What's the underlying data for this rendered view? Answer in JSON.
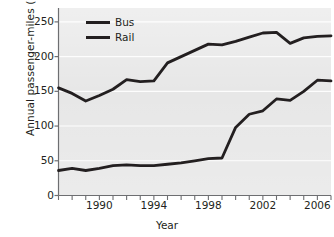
{
  "chart_data": {
    "type": "line",
    "title": "",
    "xlabel": "Year",
    "ylabel": "Annual passenger-miles (millions)",
    "xlim": [
      1987,
      2007
    ],
    "ylim": [
      0,
      270
    ],
    "yticks": [
      0,
      50,
      100,
      150,
      200,
      250
    ],
    "ytick_labels": [
      "0",
      "50",
      "100",
      "150",
      "200",
      "250"
    ],
    "xticks": [
      1987,
      1988,
      1989,
      1990,
      1991,
      1992,
      1993,
      1994,
      1995,
      1996,
      1997,
      1998,
      1999,
      2000,
      2001,
      2002,
      2003,
      2004,
      2005,
      2006,
      2007
    ],
    "xtick_labels_shown": [
      "1990",
      "1994",
      "1998",
      "2002",
      "2006"
    ],
    "xtick_label_years": [
      1990,
      1994,
      1998,
      2002,
      2006
    ],
    "grid": "horizontal-white",
    "plot_background": "#e7e7e7",
    "line_color": "#231f20",
    "legend_position": "top-center-left",
    "x": [
      1987,
      1988,
      1989,
      1990,
      1991,
      1992,
      1993,
      1994,
      1995,
      1996,
      1997,
      1998,
      1999,
      2000,
      2001,
      2002,
      2003,
      2004,
      2005,
      2006,
      2007
    ],
    "series": [
      {
        "name": "Bus",
        "values": [
          155,
          147,
          136,
          144,
          153,
          167,
          164,
          165,
          191,
          200,
          209,
          218,
          217,
          222,
          228,
          234,
          235,
          219,
          227,
          229,
          230
        ]
      },
      {
        "name": "Rail",
        "values": [
          36,
          39,
          36,
          39,
          43,
          44,
          43,
          43,
          45,
          47,
          50,
          53,
          54,
          98,
          117,
          122,
          139,
          137,
          150,
          166,
          165
        ]
      }
    ]
  },
  "legend": {
    "items": [
      {
        "label": "Bus"
      },
      {
        "label": "Rail"
      }
    ]
  }
}
